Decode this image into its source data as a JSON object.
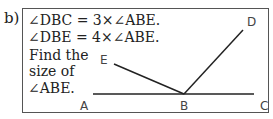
{
  "question": {
    "part_label": "b)",
    "lines": [
      "∠DBC = 3×∠ABE.",
      "∠DBE = 4×∠ABE.",
      "Find the",
      "size of",
      "∠ABE."
    ]
  },
  "diagram": {
    "points": {
      "A": "A",
      "B": "B",
      "C": "C",
      "D": "D",
      "E": "E"
    },
    "line_color": "#222222"
  }
}
